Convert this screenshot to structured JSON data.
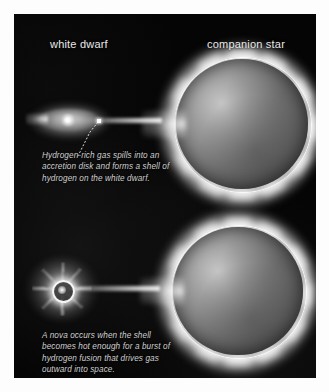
{
  "figure": {
    "background_color": "#ffffff",
    "panel_color": "#050505",
    "label_color": "#e9e9e9",
    "caption_color": "#cfcfcf"
  },
  "labels": {
    "white_dwarf": "white dwarf",
    "companion_star": "companion star"
  },
  "captions": {
    "top": {
      "full": "Hydrogen-rich gas spills into an accretion disk and forms a shell of hydrogen on the white dwarf.",
      "lines": [
        "Hydrogen-rich gas spills into an",
        "accretion disk and forms a shell of",
        "hydrogen on the white dwarf."
      ]
    },
    "bottom": {
      "full": "A nova occurs when the shell becomes hot enough for a burst of hydrogen fusion that drives gas outward into space.",
      "lines": [
        "A nova occurs when the shell",
        "becomes hot enough for a burst of",
        "hydrogen fusion that drives gas",
        "outward into space."
      ]
    }
  },
  "scenes": [
    {
      "id": "accretion-phase",
      "objects": [
        "accretion-disk",
        "white-dwarf",
        "gas-stream",
        "companion-star"
      ]
    },
    {
      "id": "nova-phase",
      "objects": [
        "nova-burst",
        "white-dwarf",
        "gas-stream",
        "companion-star"
      ]
    }
  ]
}
